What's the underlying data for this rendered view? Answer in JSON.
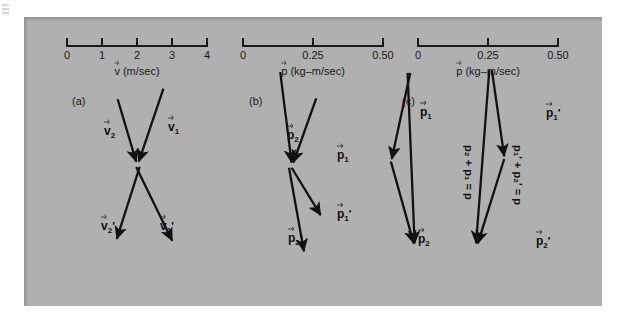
{
  "figure": {
    "background_color": "#b0b0b0",
    "ink_color": "#1a1a1a",
    "paper_color": "#ffffff"
  },
  "scales": [
    {
      "id": "velocity-scale",
      "caption_symbol": "v",
      "caption_units": "(m/sec)",
      "ticks": [
        "0",
        "1",
        "2",
        "3",
        "4"
      ],
      "min": 0,
      "max": 4
    },
    {
      "id": "momentum-scale-b",
      "caption_symbol": "p",
      "caption_units": "(kg–m/sec)",
      "ticks": [
        "0",
        "0.25",
        "0.50"
      ],
      "min": 0,
      "max": 0.5
    },
    {
      "id": "momentum-scale-c",
      "caption_symbol": "p",
      "caption_units": "(kg–m/sec)",
      "ticks": [
        "0",
        "0.25",
        "0.50"
      ],
      "min": 0,
      "max": 0.5
    }
  ],
  "panels": [
    {
      "id": "panel-a",
      "letter": "(a)"
    },
    {
      "id": "panel-b",
      "letter": "(b)"
    },
    {
      "id": "panel-c",
      "letter": "(c)"
    }
  ],
  "labels": {
    "a": {
      "v2": {
        "sym": "v",
        "sub": "2",
        "prime": ""
      },
      "v1": {
        "sym": "v",
        "sub": "1",
        "prime": ""
      },
      "v2prime": {
        "sym": "v",
        "sub": "2",
        "prime": "′"
      },
      "v1prime": {
        "sym": "v",
        "sub": "1",
        "prime": "′"
      }
    },
    "b": {
      "p2": {
        "sym": "p",
        "sub": "2",
        "prime": ""
      },
      "p1": {
        "sym": "p",
        "sub": "1",
        "prime": ""
      },
      "p1prime": {
        "sym": "p",
        "sub": "1",
        "prime": "′"
      },
      "p2prime": {
        "sym": "p",
        "sub": "2",
        "prime": "′"
      }
    },
    "c": {
      "p1": {
        "sym": "p",
        "sub": "1",
        "prime": ""
      },
      "p2": {
        "sym": "p",
        "sub": "2",
        "prime": ""
      },
      "p1prime": {
        "sym": "p",
        "sub": "1",
        "prime": "′"
      },
      "p2prime": {
        "sym": "p",
        "sub": "2",
        "prime": "′"
      }
    }
  },
  "equations": {
    "left": {
      "terms": [
        "p",
        "2"
      ],
      "text": "p₂ + p₁ = p"
    },
    "right": {
      "terms": [
        "p",
        "2"
      ],
      "text": "p₁′ + p₂′ = p"
    }
  }
}
